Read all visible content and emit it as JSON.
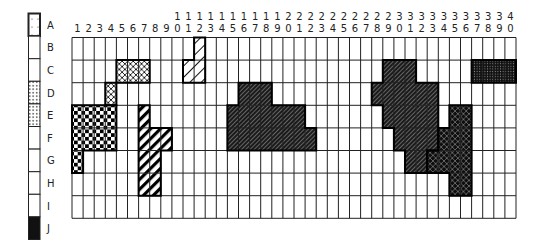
{
  "diagram": {
    "type": "grid-occupancy-map",
    "grid": {
      "columns": 40,
      "rows": 8,
      "row_labels": [
        "B",
        "C",
        "D",
        "E",
        "F",
        "G",
        "H",
        "I"
      ]
    },
    "column_labels": [
      "1",
      "2",
      "3",
      "4",
      "5",
      "6",
      "7",
      "8",
      "9",
      "10",
      "11",
      "12",
      "13",
      "14",
      "15",
      "16",
      "17",
      "18",
      "19",
      "20",
      "21",
      "22",
      "23",
      "24",
      "25",
      "26",
      "27",
      "28",
      "29",
      "30",
      "31",
      "32",
      "33",
      "34",
      "35",
      "36",
      "37",
      "38",
      "39",
      "40"
    ],
    "legend": [
      {
        "label": "A",
        "pattern": "sparse-dots",
        "bold_border": true
      },
      {
        "label": "B",
        "pattern": "none"
      },
      {
        "label": "C",
        "pattern": "none"
      },
      {
        "label": "D",
        "pattern": "dots"
      },
      {
        "label": "E",
        "pattern": "dots"
      },
      {
        "label": "F",
        "pattern": "none"
      },
      {
        "label": "G",
        "pattern": "none"
      },
      {
        "label": "H",
        "pattern": "none"
      },
      {
        "label": "I",
        "pattern": "none"
      },
      {
        "label": "J",
        "pattern": "solid-black"
      }
    ],
    "regions": [
      {
        "name": "crosshatch-left",
        "pattern": "crosshatch-white",
        "cells": [
          [
            "C",
            5
          ],
          [
            "C",
            6
          ],
          [
            "C",
            7
          ],
          [
            "D",
            4
          ]
        ]
      },
      {
        "name": "checkerboard",
        "pattern": "checker",
        "cells": [
          [
            "E",
            1
          ],
          [
            "E",
            2
          ],
          [
            "E",
            3
          ],
          [
            "E",
            4
          ],
          [
            "F",
            1
          ],
          [
            "F",
            2
          ],
          [
            "F",
            3
          ],
          [
            "F",
            4
          ],
          [
            "G",
            1
          ]
        ]
      },
      {
        "name": "wide-stripes",
        "pattern": "wide-diagonal",
        "cells": [
          [
            "E",
            7
          ],
          [
            "F",
            7
          ],
          [
            "F",
            8
          ],
          [
            "F",
            9
          ],
          [
            "G",
            7
          ],
          [
            "G",
            8
          ],
          [
            "H",
            7
          ],
          [
            "H",
            8
          ]
        ]
      },
      {
        "name": "light-hatch-top",
        "pattern": "light-diagonal",
        "cells": [
          [
            "B",
            12
          ],
          [
            "C",
            11
          ],
          [
            "C",
            12
          ]
        ]
      },
      {
        "name": "dark-hatch-center",
        "pattern": "dark-diagonal",
        "cells": [
          [
            "D",
            16
          ],
          [
            "D",
            17
          ],
          [
            "D",
            18
          ],
          [
            "E",
            15
          ],
          [
            "E",
            16
          ],
          [
            "E",
            17
          ],
          [
            "E",
            18
          ],
          [
            "E",
            19
          ],
          [
            "E",
            20
          ],
          [
            "E",
            21
          ],
          [
            "F",
            15
          ],
          [
            "F",
            16
          ],
          [
            "F",
            17
          ],
          [
            "F",
            18
          ],
          [
            "F",
            19
          ],
          [
            "F",
            20
          ],
          [
            "F",
            21
          ],
          [
            "F",
            22
          ]
        ]
      },
      {
        "name": "dark-hatch-right",
        "pattern": "dark-diagonal",
        "cells": [
          [
            "C",
            29
          ],
          [
            "C",
            30
          ],
          [
            "C",
            31
          ],
          [
            "D",
            28
          ],
          [
            "D",
            29
          ],
          [
            "D",
            30
          ],
          [
            "D",
            31
          ],
          [
            "D",
            32
          ],
          [
            "D",
            33
          ],
          [
            "E",
            29
          ],
          [
            "E",
            30
          ],
          [
            "E",
            31
          ],
          [
            "E",
            32
          ],
          [
            "E",
            33
          ],
          [
            "F",
            30
          ],
          [
            "F",
            31
          ],
          [
            "F",
            32
          ],
          [
            "F",
            33
          ],
          [
            "G",
            31
          ],
          [
            "G",
            32
          ]
        ]
      },
      {
        "name": "dark-crosshatch-right",
        "pattern": "dark-crosshatch",
        "cells": [
          [
            "E",
            35
          ],
          [
            "E",
            36
          ],
          [
            "F",
            34
          ],
          [
            "F",
            35
          ],
          [
            "F",
            36
          ],
          [
            "G",
            33
          ],
          [
            "G",
            34
          ],
          [
            "G",
            35
          ],
          [
            "G",
            36
          ],
          [
            "H",
            35
          ],
          [
            "H",
            36
          ]
        ]
      },
      {
        "name": "dark-dots-top-right",
        "pattern": "dark-dots",
        "cells": [
          [
            "C",
            37
          ],
          [
            "C",
            38
          ],
          [
            "C",
            39
          ],
          [
            "C",
            40
          ]
        ]
      }
    ],
    "colors": {
      "line": "#222222",
      "fill_dark": "#111111",
      "background": "#ffffff"
    }
  }
}
